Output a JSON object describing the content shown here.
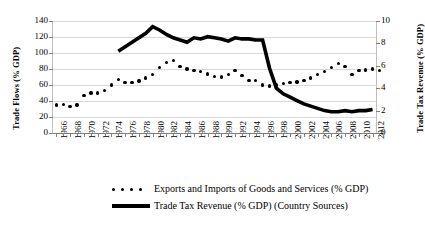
{
  "chart_data": {
    "type": "line",
    "title": "",
    "xlabel": "",
    "grid": true,
    "legend_position": "bottom",
    "x_tick_labels": [
      "1966",
      "1968",
      "1970",
      "1972",
      "1974",
      "1976",
      "1978",
      "1980",
      "1982",
      "1984",
      "1986",
      "1988",
      "1990",
      "1992",
      "1994",
      "1996",
      "1998",
      "2000",
      "2002",
      "2004",
      "2006",
      "2008",
      "2010",
      "2012"
    ],
    "x_range": [
      1966,
      2013
    ],
    "axes": [
      {
        "id": "left",
        "label": "Trade Flows (% GDP)",
        "ylim": [
          0,
          140
        ],
        "ticks": [
          0,
          20,
          40,
          60,
          80,
          100,
          120,
          140
        ]
      },
      {
        "id": "right",
        "label": "Trade Tax Revenue (% GDP)",
        "ylim": [
          0,
          10
        ],
        "ticks": [
          0,
          2,
          4,
          6,
          8,
          10
        ]
      }
    ],
    "series": [
      {
        "name": "Exports and Imports of Goods and Services (% GDP)",
        "axis": "left",
        "style": "dotted-markers",
        "color": "#000000",
        "x": [
          1966,
          1967,
          1968,
          1969,
          1970,
          1971,
          1972,
          1973,
          1974,
          1975,
          1976,
          1977,
          1978,
          1979,
          1980,
          1981,
          1982,
          1983,
          1984,
          1985,
          1986,
          1987,
          1988,
          1989,
          1990,
          1991,
          1992,
          1993,
          1994,
          1995,
          1996,
          1997,
          1998,
          1999,
          2000,
          2001,
          2002,
          2003,
          2004,
          2005,
          2006,
          2007,
          2008,
          2009,
          2010,
          2011,
          2012,
          2013
        ],
        "values": [
          35,
          36,
          33,
          35,
          47,
          50,
          50,
          53,
          60,
          67,
          63,
          63,
          65,
          69,
          73,
          82,
          88,
          91,
          83,
          80,
          78,
          77,
          74,
          71,
          70,
          73,
          78,
          72,
          66,
          66,
          60,
          59,
          60,
          62,
          63,
          64,
          66,
          69,
          73,
          77,
          82,
          87,
          83,
          73,
          78,
          79,
          80,
          78
        ]
      },
      {
        "name": "Trade Tax Revenue (% GDP) (Country Sources)",
        "axis": "right",
        "style": "thick-line",
        "color": "#000000",
        "x": [
          1975,
          1976,
          1977,
          1978,
          1979,
          1980,
          1981,
          1982,
          1983,
          1984,
          1985,
          1986,
          1987,
          1988,
          1989,
          1990,
          1991,
          1992,
          1993,
          1994,
          1995,
          1996,
          1997,
          1998,
          1999,
          2000,
          2001,
          2002,
          2003,
          2004,
          2005,
          2006,
          2007,
          2008,
          2009,
          2010,
          2011,
          2012
        ],
        "values": [
          7.3,
          7.7,
          8.1,
          8.5,
          8.9,
          9.5,
          9.2,
          8.8,
          8.5,
          8.3,
          8.1,
          8.5,
          8.4,
          8.6,
          8.5,
          8.4,
          8.2,
          8.5,
          8.4,
          8.4,
          8.3,
          8.3,
          5.8,
          4.0,
          3.5,
          3.2,
          2.9,
          2.6,
          2.4,
          2.2,
          2.0,
          1.9,
          1.9,
          2.0,
          1.9,
          2.0,
          2.0,
          2.1
        ]
      }
    ]
  }
}
